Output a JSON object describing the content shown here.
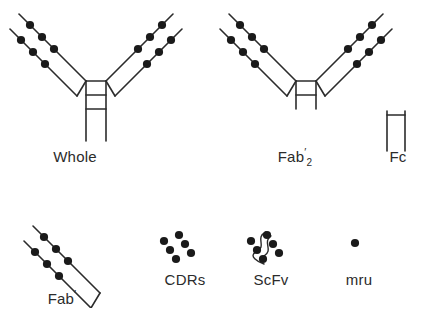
{
  "figure": {
    "background_color": "#ffffff",
    "line_color": "#2b2b2b",
    "dot_color": "#1a1a1a",
    "width": 427,
    "height": 333
  },
  "labels": {
    "whole": "Whole",
    "fab2_base": "Fab",
    "fab2_prime": "′",
    "fab2_subscript": "2",
    "fc": "Fc",
    "fab_prime_base": "Fab",
    "fab_prime_mark": "′",
    "cdrs": "CDRs",
    "scfv": "ScFv",
    "mru": "mru"
  },
  "structures": [
    {
      "name": "whole",
      "label": "Whole",
      "description": "Complete Y-shaped immunoglobulin",
      "arms": 2,
      "cdr_dots_per_chain": 3,
      "chains_per_arm": 2,
      "hinge_crossbars": 2,
      "has_fc_tail": true
    },
    {
      "name": "fab2",
      "label": "Fab'2",
      "description": "F(ab')2 fragment: two arms joined at hinge, no Fc tail",
      "arms": 2,
      "cdr_dots_per_chain": 3,
      "chains_per_arm": 2,
      "hinge_crossbars": 2,
      "has_fc_tail": false
    },
    {
      "name": "fc",
      "label": "Fc",
      "description": "Fc fragment: two parallel chains with one crossbar",
      "arms": 0,
      "cdr_dots_per_chain": 0,
      "chains_per_arm": 2,
      "hinge_crossbars": 1,
      "has_fc_tail": true
    },
    {
      "name": "fab_prime",
      "label": "Fab'",
      "description": "Single Fab' arm",
      "arms": 1,
      "cdr_dots_per_chain": 3,
      "chains_per_arm": 2,
      "hinge_crossbars": 0,
      "has_fc_tail": false
    },
    {
      "name": "cdrs",
      "label": "CDRs",
      "description": "Complementarity determining regions: six dots only",
      "arms": 0,
      "cdr_dots_per_chain": 3,
      "chains_per_arm": 2,
      "hinge_crossbars": 0,
      "has_fc_tail": false
    },
    {
      "name": "scfv",
      "label": "ScFv",
      "description": "Single chain variable fragment: six dots joined by a linker loop",
      "arms": 0,
      "cdr_dots_per_chain": 3,
      "chains_per_arm": 2,
      "hinge_crossbars": 0,
      "has_linker": true,
      "has_fc_tail": false
    },
    {
      "name": "mru",
      "label": "mru",
      "description": "Minimal recognition unit: a single dot",
      "arms": 0,
      "cdr_dots_per_chain": 1,
      "chains_per_arm": 1,
      "hinge_crossbars": 0,
      "has_fc_tail": false
    }
  ]
}
